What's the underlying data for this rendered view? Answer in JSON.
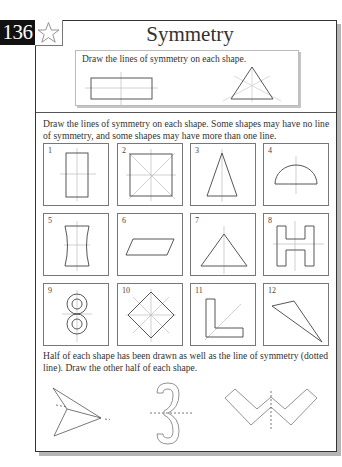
{
  "page": {
    "number": "136",
    "title": "Symmetry",
    "star_icon": "star-outline-icon"
  },
  "example": {
    "instruction": "Draw the lines of symmetry on each shape.",
    "shapes": [
      "rectangle-with-2-lines",
      "equilateral-triangle-with-3-lines"
    ]
  },
  "section1": {
    "instruction": "Draw the lines of symmetry on each shape. Some shapes may have no line of symmetry, and some shapes may have more than one line.",
    "items": [
      {
        "n": "1",
        "shape": "rectangle"
      },
      {
        "n": "2",
        "shape": "square"
      },
      {
        "n": "3",
        "shape": "isosceles-triangle"
      },
      {
        "n": "4",
        "shape": "semicircle"
      },
      {
        "n": "5",
        "shape": "concave-sided-rectangle"
      },
      {
        "n": "6",
        "shape": "parallelogram"
      },
      {
        "n": "7",
        "shape": "triangle"
      },
      {
        "n": "8",
        "shape": "letter-H"
      },
      {
        "n": "9",
        "shape": "figure-eight-rings"
      },
      {
        "n": "10",
        "shape": "rhombus"
      },
      {
        "n": "11",
        "shape": "letter-L"
      },
      {
        "n": "12",
        "shape": "scalene-triangle"
      }
    ]
  },
  "section2": {
    "instruction": "Half of each shape has been drawn as well as the line of symmetry (dotted line). Draw the other half of each shape.",
    "shapes": [
      "arrowhead-half",
      "number-3-half",
      "letter-W-half"
    ]
  },
  "colors": {
    "ink": "#333333",
    "guide": "#b8b8b8",
    "shadow": "#b5b5b5"
  }
}
